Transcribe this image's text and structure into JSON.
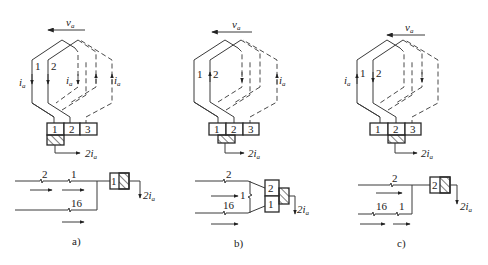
{
  "figure": {
    "panels": [
      {
        "caption": "a)",
        "velocity_label": "v",
        "velocity_sub": "a",
        "coil_labels": [
          "1",
          "2"
        ],
        "current_labels": [
          {
            "main": "i",
            "sub": "a"
          },
          {
            "main": "i",
            "sub": "a"
          },
          {
            "main": "i",
            "sub": "a"
          }
        ],
        "segments": [
          "1",
          "2",
          "3"
        ],
        "brush_under": "1",
        "brush_current": {
          "main": "2i",
          "sub": "a"
        },
        "circuit": {
          "top_line_labels": [
            "2",
            "1"
          ],
          "bottom_line_labels": [
            "16"
          ],
          "box_labels": [
            "1"
          ],
          "output_current": {
            "main": "2i",
            "sub": "a"
          }
        }
      },
      {
        "caption": "b)",
        "velocity_label": "v",
        "velocity_sub": "a",
        "coil_labels": [
          "1",
          "2"
        ],
        "current_labels": [
          {
            "main": "i",
            "sub": "a"
          }
        ],
        "segments": [
          "1",
          "2",
          "3"
        ],
        "brush_under": "1-2",
        "brush_current": {
          "main": "2i",
          "sub": "a"
        },
        "circuit": {
          "top_line_labels": [
            "2"
          ],
          "middle_labels": [
            "1"
          ],
          "bottom_line_labels": [
            "16"
          ],
          "box_labels": [
            "2",
            "1"
          ],
          "output_current": {
            "main": "2i",
            "sub": "a"
          }
        }
      },
      {
        "caption": "c)",
        "velocity_label": "v",
        "velocity_sub": "a",
        "coil_labels": [
          "1",
          "2"
        ],
        "current_labels": [
          {
            "main": "i",
            "sub": "a"
          }
        ],
        "segments": [
          "1",
          "2",
          "3"
        ],
        "brush_under": "2",
        "brush_current": {
          "main": "2i",
          "sub": "a"
        },
        "circuit": {
          "top_line_labels": [
            "2"
          ],
          "bottom_line_labels": [
            "16",
            "1"
          ],
          "box_labels": [
            "2"
          ],
          "output_current": {
            "main": "2i",
            "sub": "a"
          }
        }
      }
    ]
  }
}
